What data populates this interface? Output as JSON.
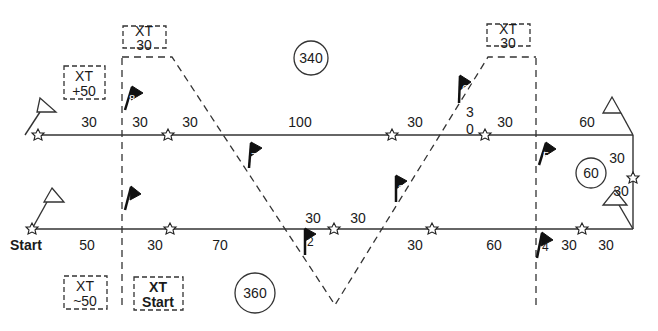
{
  "diagram": {
    "legs": {
      "top": [
        "30",
        "30",
        "30",
        "100",
        "30",
        "3",
        "0",
        "30",
        "60"
      ],
      "bottom": [
        "Start",
        "50",
        "30",
        "70",
        "30",
        "30",
        "60",
        "30",
        "30"
      ],
      "right_side": [
        "30",
        "30"
      ]
    },
    "circles": {
      "top": "340",
      "bottom": "360",
      "right": "60"
    },
    "xt_boxes": {
      "plus50": [
        "XT",
        "+50"
      ],
      "top_30_left": [
        "XT",
        "30"
      ],
      "top_30_right": [
        "XT",
        "30"
      ],
      "minus50": [
        "XT",
        "~50"
      ],
      "start": [
        "XT",
        "Start"
      ]
    },
    "flags": [
      "1",
      "2",
      "3",
      "4",
      "5",
      "6",
      "7",
      "8"
    ],
    "extra_labels": {
      "mid30a": "30",
      "mid30b": "30"
    }
  }
}
